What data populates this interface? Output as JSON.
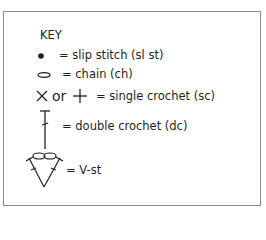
{
  "key": {
    "title": "KEY",
    "entries": [
      {
        "symbol": "filled-dot",
        "label": "= slip stitch (sl st)"
      },
      {
        "symbol": "oval",
        "label": "= chain (ch)"
      },
      {
        "symbol": "x-or-plus",
        "connector": "or",
        "label": "= single crochet (sc)"
      },
      {
        "symbol": "t-bar-with-slash",
        "label": "= double crochet (dc)"
      },
      {
        "symbol": "v-stitch",
        "label": "= V-st"
      }
    ]
  }
}
